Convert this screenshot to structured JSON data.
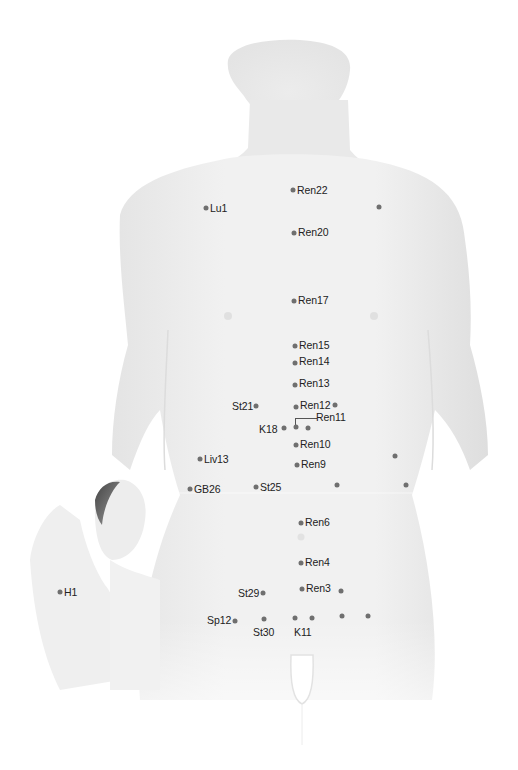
{
  "diagram": {
    "colors": {
      "skin_light": "#f2f2f2",
      "skin_mid": "#e2e2e2",
      "point": "#6f6f6f",
      "label": "#222222"
    },
    "points": [
      {
        "id": "ren22",
        "label": "Ren22",
        "x": 293,
        "y": 190,
        "lx": 297,
        "ly": 185,
        "side": "right"
      },
      {
        "id": "lu1",
        "label": "Lu1",
        "x": 206,
        "y": 208,
        "lx": 210,
        "ly": 203,
        "side": "right"
      },
      {
        "id": "lu1-r",
        "label": "",
        "x": 379,
        "y": 207
      },
      {
        "id": "ren20",
        "label": "Ren20",
        "x": 294,
        "y": 233,
        "lx": 298,
        "ly": 227,
        "side": "right"
      },
      {
        "id": "ren17",
        "label": "Ren17",
        "x": 294,
        "y": 301,
        "lx": 298,
        "ly": 295,
        "side": "right"
      },
      {
        "id": "ren15",
        "label": "Ren15",
        "x": 295,
        "y": 346,
        "lx": 299,
        "ly": 340,
        "side": "right"
      },
      {
        "id": "ren14",
        "label": "Ren14",
        "x": 295,
        "y": 363,
        "lx": 299,
        "ly": 356,
        "side": "right"
      },
      {
        "id": "ren13",
        "label": "Ren13",
        "x": 295,
        "y": 385,
        "lx": 299,
        "ly": 378,
        "side": "right"
      },
      {
        "id": "st21",
        "label": "St21",
        "x": 256,
        "y": 406,
        "lx": 232,
        "ly": 401,
        "side": "left"
      },
      {
        "id": "ren12",
        "label": "Ren12",
        "x": 296,
        "y": 407,
        "lx": 300,
        "ly": 400,
        "side": "right"
      },
      {
        "id": "st21-r",
        "label": "",
        "x": 335,
        "y": 405
      },
      {
        "id": "ren11",
        "label": "Ren11",
        "x": 296,
        "y": 427,
        "lx": 316,
        "ly": 412,
        "side": "right"
      },
      {
        "id": "k18",
        "label": "K18",
        "x": 284,
        "y": 428,
        "lx": 259,
        "ly": 424,
        "side": "left"
      },
      {
        "id": "k18-r",
        "label": "",
        "x": 308,
        "y": 428
      },
      {
        "id": "ren10",
        "label": "Ren10",
        "x": 296,
        "y": 445,
        "lx": 300,
        "ly": 439,
        "side": "right"
      },
      {
        "id": "liv13",
        "label": "Liv13",
        "x": 200,
        "y": 459,
        "lx": 204,
        "ly": 454,
        "side": "right"
      },
      {
        "id": "liv13-r",
        "label": "",
        "x": 395,
        "y": 456
      },
      {
        "id": "ren9",
        "label": "Ren9",
        "x": 297,
        "y": 465,
        "lx": 301,
        "ly": 459,
        "side": "right"
      },
      {
        "id": "gb26",
        "label": "GB26",
        "x": 190,
        "y": 489,
        "lx": 194,
        "ly": 484,
        "side": "right"
      },
      {
        "id": "st25",
        "label": "St25",
        "x": 256,
        "y": 487,
        "lx": 260,
        "ly": 482,
        "side": "right"
      },
      {
        "id": "st25-r",
        "label": "",
        "x": 337,
        "y": 485
      },
      {
        "id": "gb26-r",
        "label": "",
        "x": 406,
        "y": 485
      },
      {
        "id": "ren6",
        "label": "Ren6",
        "x": 301,
        "y": 523,
        "lx": 305,
        "ly": 517,
        "side": "right"
      },
      {
        "id": "ren4",
        "label": "Ren4",
        "x": 301,
        "y": 563,
        "lx": 305,
        "ly": 557,
        "side": "right"
      },
      {
        "id": "st29",
        "label": "St29",
        "x": 263,
        "y": 593,
        "lx": 238,
        "ly": 588,
        "side": "left"
      },
      {
        "id": "ren3",
        "label": "Ren3",
        "x": 302,
        "y": 589,
        "lx": 306,
        "ly": 583,
        "side": "right"
      },
      {
        "id": "st29-r",
        "label": "",
        "x": 341,
        "y": 591
      },
      {
        "id": "sp12",
        "label": "Sp12",
        "x": 235,
        "y": 621,
        "lx": 207,
        "ly": 615,
        "side": "left"
      },
      {
        "id": "st30",
        "label": "St30",
        "x": 264,
        "y": 619,
        "lx": 253,
        "ly": 627,
        "side": "below"
      },
      {
        "id": "k11",
        "label": "K11",
        "x": 295,
        "y": 618,
        "lx": 294,
        "ly": 627,
        "side": "below"
      },
      {
        "id": "k11-r",
        "label": "",
        "x": 312,
        "y": 618
      },
      {
        "id": "st30-r",
        "label": "",
        "x": 342,
        "y": 616
      },
      {
        "id": "sp12-r",
        "label": "",
        "x": 368,
        "y": 616
      },
      {
        "id": "h1",
        "label": "H1",
        "x": 60,
        "y": 592,
        "lx": 64,
        "ly": 587,
        "side": "right"
      }
    ]
  }
}
